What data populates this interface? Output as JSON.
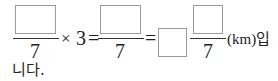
{
  "expression": {
    "fraction1": {
      "numerator": "",
      "denominator": "7"
    },
    "multiply_sign": "×",
    "multiplier": "3",
    "equals1": "=",
    "fraction2": {
      "numerator": "",
      "denominator": "7"
    },
    "equals2": "=",
    "mixed_whole": "",
    "fraction3": {
      "numerator": "",
      "denominator": "7"
    },
    "unit": "(km)입",
    "continuation": "니다."
  }
}
